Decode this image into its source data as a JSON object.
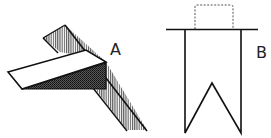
{
  "figure": {
    "labels": {
      "a": "A",
      "b": "B"
    },
    "colors": {
      "stroke": "#111111",
      "hatch": "#333333",
      "background": "#ffffff"
    },
    "panels": [
      {
        "id": "A",
        "content": "folded flap over hatched diagonal band with dark shaded underside"
      },
      {
        "id": "B",
        "content": "swallow-tail pennant shape under horizontal line, dashed rectangle above"
      }
    ]
  }
}
